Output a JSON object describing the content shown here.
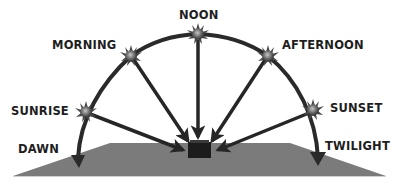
{
  "diagram": {
    "type": "sun-path",
    "labels": {
      "noon": "NOON",
      "morning": "MORNING",
      "afternoon": "AFTERNOON",
      "sunrise": "SUNRISE",
      "sunset": "SUNSET",
      "dawn": "DAWN",
      "twilight": "TWILIGHT"
    },
    "colors": {
      "ground": "#7b7b7b",
      "arc": "#2a2a2a",
      "arrow": "#262626",
      "box": "#1c1c1c",
      "sun_core": "#8a8a8a",
      "sun_rays": "#4a4a4a",
      "text": "#1e1e1e"
    }
  }
}
